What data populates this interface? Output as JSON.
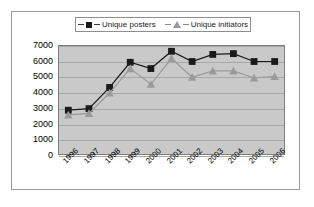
{
  "figure": {
    "border_color": "#9b9b9b",
    "background": "#ffffff",
    "plot_background": "#c9c9c9"
  },
  "legend": {
    "position": "top-center",
    "entries": [
      {
        "label": "Unique posters",
        "marker": "square-marker-icon",
        "color": "#1a1a1a"
      },
      {
        "label": "Unique initiators",
        "marker": "triangle-marker-icon",
        "color": "#9a9a9a"
      }
    ]
  },
  "chart_data": {
    "type": "line",
    "title": "",
    "xlabel": "",
    "ylabel": "",
    "ylim": [
      0,
      7000
    ],
    "ytick_step": 1000,
    "yticks": [
      "0",
      "1000",
      "2000",
      "3000",
      "4000",
      "5000",
      "6000",
      "7000"
    ],
    "grid": true,
    "legend_position": "top-center",
    "categories": [
      "1996",
      "1997",
      "1998",
      "1999",
      "2000",
      "2001",
      "2002",
      "2003",
      "2004",
      "2005",
      "2006"
    ],
    "series": [
      {
        "name": "Unique posters",
        "color": "#1a1a1a",
        "marker": "square",
        "values": [
          2850,
          2950,
          4300,
          5900,
          5500,
          6600,
          5950,
          6400,
          6450,
          5950,
          5950
        ]
      },
      {
        "name": "Unique initiators",
        "color": "#9a9a9a",
        "marker": "triangle",
        "values": [
          2550,
          2650,
          3950,
          5500,
          4500,
          6150,
          4950,
          5350,
          5350,
          4900,
          5000
        ]
      }
    ]
  }
}
